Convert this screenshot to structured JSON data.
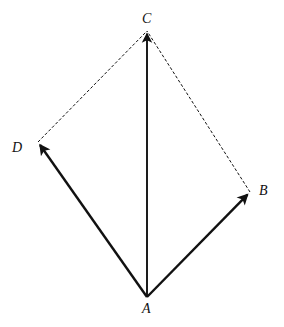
{
  "figure": {
    "background_color": "#ffffff",
    "ink_color": "#111111",
    "width": 284,
    "height": 327
  },
  "points": {
    "A": {
      "label": "A",
      "x": 147,
      "y": 297,
      "role": "origin"
    },
    "B": {
      "label": "B",
      "x": 250,
      "y": 192,
      "role": "vector-tip"
    },
    "C": {
      "label": "C",
      "x": 147,
      "y": 31,
      "role": "resultant-tip"
    },
    "D": {
      "label": "D",
      "x": 38,
      "y": 142,
      "role": "vector-tip"
    }
  },
  "vectors": [
    {
      "name": "AD",
      "from": "A",
      "to": "D",
      "style": "solid",
      "arrowhead": "end",
      "stroke_width": 2.4,
      "x1": 147,
      "y1": 297,
      "x2": 38,
      "y2": 142
    },
    {
      "name": "AB",
      "from": "A",
      "to": "B",
      "style": "solid",
      "arrowhead": "end",
      "stroke_width": 2.4,
      "x1": 147,
      "y1": 297,
      "x2": 250,
      "y2": 192
    },
    {
      "name": "AC",
      "from": "A",
      "to": "C",
      "style": "solid",
      "arrowhead": "end",
      "stroke_width": 1.9,
      "x1": 147,
      "y1": 297,
      "x2": 147,
      "y2": 31
    }
  ],
  "construction_lines": [
    {
      "name": "DC",
      "from": "D",
      "to": "C",
      "style": "dashed",
      "arrowhead": "none",
      "stroke_width": 1,
      "dash_pattern": "3 2",
      "x1": 38,
      "y1": 142,
      "x2": 147,
      "y2": 31
    },
    {
      "name": "BC",
      "from": "B",
      "to": "C",
      "style": "dashed",
      "arrowhead": "none",
      "stroke_width": 1,
      "dash_pattern": "3 2",
      "x1": 250,
      "y1": 192,
      "x2": 147,
      "y2": 31
    }
  ]
}
